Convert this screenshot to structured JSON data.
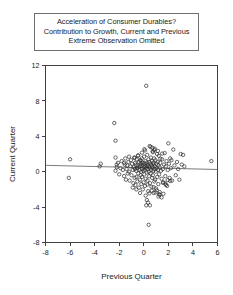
{
  "chart_data": {
    "type": "scatter",
    "title": "Acceleration of Consumer Durables? Contribution to Growth, Current and Previous Extreme Observation Omitted",
    "title_lines": [
      "Acceleration of Consumer Durables?",
      "Contribution to Growth, Current and Previous",
      "Extreme Observation Omitted"
    ],
    "xlabel": "Previous Quarter",
    "ylabel": "Current Quarter",
    "xlim": [
      -8,
      6
    ],
    "ylim": [
      -8,
      12
    ],
    "xticks": [
      -8,
      -6,
      -4,
      -2,
      0,
      2,
      4,
      6
    ],
    "xtick_labels": [
      "-8",
      "-6",
      "-4",
      "-2",
      "0",
      "2",
      "4",
      "6"
    ],
    "yticks": [
      -8,
      -4,
      0,
      4,
      8,
      12
    ],
    "ytick_labels": [
      "-8",
      "-4",
      "0",
      "4",
      "8",
      "12"
    ],
    "grid": false,
    "legend": "none",
    "marker": "open-circle",
    "marker_color": "#2b2b2b",
    "fit_line": {
      "name": "linear fit",
      "color": "#6b6b6b",
      "x_start": -8,
      "y_start": 0.72,
      "x_end": 6,
      "y_end": 0.25
    },
    "x": [
      -6.1,
      -6.0,
      -3.6,
      -3.5,
      -2.4,
      -2.3,
      -2.3,
      -2.2,
      -2.1,
      -2.0,
      -1.9,
      -1.8,
      -1.7,
      -1.6,
      -1.55,
      -1.5,
      -1.45,
      -1.4,
      -1.35,
      -1.3,
      -1.25,
      -1.2,
      -1.15,
      -1.1,
      -1.05,
      -1.0,
      -0.95,
      -0.9,
      -0.85,
      -0.8,
      -0.78,
      -0.75,
      -0.72,
      -0.7,
      -0.68,
      -0.65,
      -0.62,
      -0.6,
      -0.58,
      -0.55,
      -0.52,
      -0.5,
      -0.48,
      -0.45,
      -0.42,
      -0.4,
      -0.38,
      -0.35,
      -0.32,
      -0.3,
      -0.28,
      -0.26,
      -0.24,
      -0.22,
      -0.2,
      -0.18,
      -0.16,
      -0.14,
      -0.12,
      -0.1,
      -0.08,
      -0.06,
      -0.04,
      -0.02,
      0.0,
      0.02,
      0.04,
      0.06,
      0.08,
      0.1,
      0.12,
      0.14,
      0.16,
      0.18,
      0.2,
      0.22,
      0.24,
      0.26,
      0.28,
      0.3,
      0.32,
      0.34,
      0.36,
      0.38,
      0.4,
      0.42,
      0.44,
      0.46,
      0.48,
      0.5,
      0.52,
      0.54,
      0.56,
      0.58,
      0.6,
      0.62,
      0.64,
      0.66,
      0.68,
      0.7,
      0.72,
      0.74,
      0.76,
      0.78,
      0.8,
      0.82,
      0.84,
      0.86,
      0.88,
      0.9,
      0.92,
      0.95,
      0.98,
      1.0,
      1.02,
      1.05,
      1.08,
      1.1,
      1.12,
      1.15,
      1.18,
      1.2,
      1.22,
      1.25,
      1.28,
      1.3,
      1.35,
      1.4,
      1.45,
      1.5,
      1.55,
      1.6,
      1.65,
      1.7,
      1.75,
      1.8,
      1.85,
      1.9,
      1.95,
      2.0,
      2.05,
      2.1,
      2.15,
      2.2,
      2.3,
      2.4,
      2.5,
      2.6,
      2.7,
      2.8,
      2.9,
      3.0,
      3.1,
      3.2,
      3.3,
      5.5,
      0.4,
      0.2,
      -2.3,
      -2.2,
      0.5,
      1.2,
      1.6,
      0.9,
      -0.6,
      -0.3,
      0.1,
      0.7,
      1.3,
      1.8,
      0.35,
      0.75,
      1.05,
      -0.9,
      -1.2,
      0.15,
      0.55,
      1.45,
      2.25,
      -1.6,
      0.25,
      0.85,
      1.55,
      -0.45,
      0.65,
      1.15,
      1.95,
      -0.15,
      0.45,
      1.75,
      0.05,
      0.95,
      1.35,
      -0.75,
      0.3,
      1.25,
      2.15,
      -0.25,
      0.8,
      1.5
    ],
    "y": [
      -0.7,
      1.4,
      0.6,
      0.9,
      5.5,
      3.5,
      0.1,
      0.5,
      1.0,
      -0.3,
      0.4,
      1.2,
      0.2,
      -0.5,
      0.8,
      1.5,
      -0.9,
      0.3,
      0.7,
      -0.2,
      1.1,
      0.0,
      -1.0,
      0.6,
      1.3,
      -0.4,
      0.9,
      0.2,
      -1.3,
      0.5,
      1.6,
      -0.7,
      0.3,
      1.0,
      -1.5,
      0.8,
      0.1,
      -0.6,
      1.4,
      0.4,
      -1.1,
      0.7,
      1.8,
      -0.2,
      0.5,
      -1.8,
      1.1,
      0.2,
      -0.9,
      0.6,
      1.3,
      -0.4,
      0.9,
      0.0,
      -1.4,
      0.7,
      1.5,
      -0.6,
      0.3,
      1.0,
      -2.0,
      0.8,
      0.1,
      -1.2,
      0.5,
      1.7,
      -0.3,
      0.9,
      0.2,
      -1.6,
      0.6,
      1.2,
      -0.8,
      0.4,
      9.7,
      1.0,
      -0.1,
      0.7,
      1.9,
      -1.0,
      0.3,
      0.8,
      -2.2,
      1.4,
      0.0,
      0.6,
      -0.5,
      1.1,
      2.9,
      -1.3,
      0.4,
      0.9,
      -0.2,
      1.6,
      0.2,
      -1.7,
      0.7,
      1.2,
      -0.7,
      0.5,
      2.3,
      -0.4,
      1.0,
      0.1,
      -2.4,
      0.8,
      1.5,
      -1.1,
      0.3,
      0.6,
      -0.9,
      1.3,
      0.0,
      -1.9,
      0.9,
      0.4,
      2.0,
      -0.6,
      1.1,
      0.2,
      -1.4,
      0.7,
      1.8,
      -0.3,
      0.5,
      -2.6,
      1.0,
      0.1,
      -0.8,
      1.4,
      0.3,
      -1.2,
      0.8,
      2.1,
      -0.5,
      0.6,
      1.2,
      -1.6,
      0.2,
      3.2,
      0.9,
      -0.7,
      1.5,
      0.4,
      -1.0,
      2.5,
      0.7,
      -0.4,
      1.1,
      0.3,
      -0.9,
      2.0,
      0.8,
      1.9,
      0.6,
      1.2,
      -6.0,
      -3.8,
      1.6,
      0.8,
      -3.8,
      -2.8,
      -2.5,
      2.6,
      -2.0,
      -2.4,
      2.4,
      2.7,
      -2.3,
      -1.5,
      -3.5,
      2.2,
      -2.1,
      -1.8,
      1.7,
      -2.7,
      2.8,
      -2.9,
      1.3,
      1.0,
      -3.2,
      2.45,
      -1.25,
      1.85,
      -2.15,
      2.35,
      -0.95,
      2.15,
      -2.45,
      -1.35,
      2.55,
      -2.35,
      1.45,
      1.55,
      -1.45,
      -2.55,
      -1.05,
      1.25,
      -1.75,
      2.05
    ]
  }
}
